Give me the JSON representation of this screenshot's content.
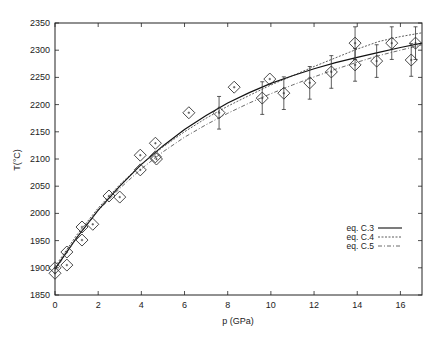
{
  "chart_data": {
    "type": "scatter",
    "title": "",
    "xlabel": "p (GPa)",
    "ylabel": "T(°C)",
    "xlim": [
      0,
      17
    ],
    "ylim": [
      1850,
      2350
    ],
    "xticks": [
      0,
      2,
      4,
      6,
      8,
      10,
      12,
      14,
      16
    ],
    "yticks": [
      1850,
      1900,
      1950,
      2000,
      2050,
      2100,
      2150,
      2200,
      2250,
      2300,
      2350
    ],
    "grid": false,
    "legend_position": "lower right",
    "points": [
      {
        "x": 0.0,
        "y": 1900,
        "err": 0
      },
      {
        "x": 0.0,
        "y": 1890,
        "err": 0
      },
      {
        "x": 0.55,
        "y": 1929,
        "err": 0
      },
      {
        "x": 0.55,
        "y": 1905,
        "err": 0
      },
      {
        "x": 1.25,
        "y": 1975,
        "err": 0
      },
      {
        "x": 1.25,
        "y": 1951,
        "err": 0
      },
      {
        "x": 1.75,
        "y": 1980,
        "err": 0
      },
      {
        "x": 2.5,
        "y": 2032,
        "err": 0
      },
      {
        "x": 3.0,
        "y": 2030,
        "err": 0
      },
      {
        "x": 3.95,
        "y": 2107,
        "err": 0
      },
      {
        "x": 3.95,
        "y": 2080,
        "err": 0
      },
      {
        "x": 4.65,
        "y": 2129,
        "err": 0
      },
      {
        "x": 4.65,
        "y": 2104,
        "err": 0
      },
      {
        "x": 4.7,
        "y": 2100,
        "err": 0
      },
      {
        "x": 6.2,
        "y": 2185,
        "err": 0
      },
      {
        "x": 7.6,
        "y": 2185,
        "err": 30
      },
      {
        "x": 8.3,
        "y": 2232,
        "err": 0
      },
      {
        "x": 9.6,
        "y": 2212,
        "err": 30
      },
      {
        "x": 9.95,
        "y": 2247,
        "err": 0
      },
      {
        "x": 10.6,
        "y": 2221,
        "err": 30
      },
      {
        "x": 11.8,
        "y": 2240,
        "err": 30
      },
      {
        "x": 12.8,
        "y": 2260,
        "err": 30
      },
      {
        "x": 13.9,
        "y": 2313,
        "err": 30
      },
      {
        "x": 13.9,
        "y": 2273,
        "err": 30
      },
      {
        "x": 14.9,
        "y": 2280,
        "err": 30
      },
      {
        "x": 15.6,
        "y": 2313,
        "err": 30
      },
      {
        "x": 16.5,
        "y": 2282,
        "err": 30
      },
      {
        "x": 16.7,
        "y": 2313,
        "err": 30
      }
    ],
    "series": [
      {
        "name": "eq. C.3",
        "style": "solid",
        "x": [
          0,
          1,
          2,
          3,
          4,
          5,
          6,
          7,
          8,
          9,
          10,
          11,
          12,
          13,
          14,
          15,
          16,
          17
        ],
        "y": [
          1898,
          1955,
          2006,
          2050,
          2090,
          2124,
          2154,
          2180,
          2203,
          2222,
          2239,
          2253,
          2266,
          2277,
          2287,
          2296,
          2305,
          2313
        ]
      },
      {
        "name": "eq. C.4",
        "style": "dashed",
        "x": [
          0,
          1,
          2,
          3,
          4,
          5,
          6,
          7,
          8,
          9,
          10,
          11,
          12,
          13,
          14,
          15,
          16,
          17
        ],
        "y": [
          1902,
          1960,
          2010,
          2053,
          2090,
          2122,
          2150,
          2175,
          2197,
          2217,
          2236,
          2253,
          2270,
          2286,
          2302,
          2316,
          2325,
          2332
        ]
      },
      {
        "name": "eq. C.5",
        "style": "dashdot",
        "x": [
          0,
          1,
          2,
          3,
          4,
          5,
          6,
          7,
          8,
          9,
          10,
          11,
          12,
          13,
          14,
          15,
          16,
          17
        ],
        "y": [
          1895,
          1955,
          2005,
          2046,
          2082,
          2113,
          2140,
          2163,
          2184,
          2203,
          2220,
          2236,
          2251,
          2265,
          2278,
          2290,
          2300,
          2310
        ]
      }
    ]
  },
  "legend": {
    "items": [
      {
        "label": "eq. C.3"
      },
      {
        "label": "eq. C.4"
      },
      {
        "label": "eq. C.5"
      }
    ]
  },
  "axes": {
    "xlabel": "p (GPa)",
    "ylabel": "T(°C)"
  }
}
